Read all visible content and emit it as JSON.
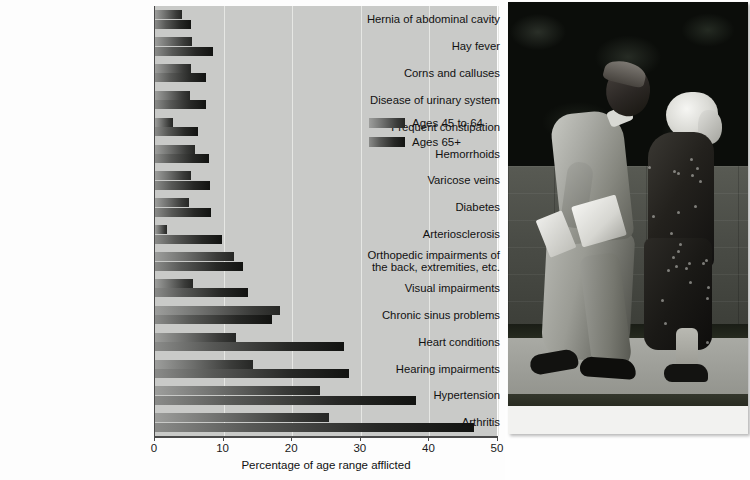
{
  "chart_data": {
    "type": "bar",
    "orientation": "horizontal",
    "grouped": true,
    "title": "",
    "xlabel": "Percentage of age range afflicted",
    "ylabel": "",
    "xlim": [
      0,
      50
    ],
    "xticks": [
      0,
      10,
      20,
      30,
      40,
      50
    ],
    "xtick_labels": [
      "0",
      "10",
      "20",
      "30",
      "40",
      "50"
    ],
    "grid": "vertical",
    "legend_position": "center-right-inside",
    "categories": [
      "Hernia of abdominal cavity",
      "Hay fever",
      "Corns and calluses",
      "Disease of urinary system",
      "Frequent constipation",
      "Hemorrhoids",
      "Varicose veins",
      "Diabetes",
      "Arteriosclerosis",
      "Orthopedic impairments of the back, extremities, etc.",
      "Visual impairments",
      "Chronic sinus problems",
      "Heart conditions",
      "Hearing impairments",
      "Hypertension",
      "Arthritis"
    ],
    "series": [
      {
        "name": "Ages 45 to 64",
        "values": [
          4.0,
          5.4,
          5.3,
          5.1,
          2.6,
          5.9,
          5.2,
          4.9,
          1.8,
          11.5,
          5.5,
          18.2,
          11.8,
          14.3,
          24.0,
          25.3
        ]
      },
      {
        "name": "Ages 65+",
        "values": [
          5.3,
          8.5,
          7.5,
          7.4,
          6.2,
          7.8,
          8.0,
          8.1,
          9.8,
          12.8,
          13.5,
          17.0,
          27.5,
          28.3,
          38.0,
          46.5
        ]
      }
    ]
  },
  "chart": {
    "x_axis_title": "Percentage of age range afflicted",
    "tick_labels": [
      "0",
      "10",
      "20",
      "30",
      "40",
      "50"
    ],
    "category_labels": [
      "Hernia of abdominal cavity",
      "Hay fever",
      "Corns and calluses",
      "Disease of urinary system",
      "Frequent constipation",
      "Hemorrhoids",
      "Varicose veins",
      "Diabetes",
      "Arteriosclerosis",
      "Orthopedic impairments of\nthe back, extremities, etc.",
      "Visual impairments",
      "Chronic sinus problems",
      "Heart conditions",
      "Hearing impairments",
      "Hypertension",
      "Arthritis"
    ],
    "legend": [
      {
        "label": "Ages 45 to 64",
        "color": "#4a4b49"
      },
      {
        "label": "Ages 65+",
        "color": "#1b1c1a"
      }
    ],
    "colors": {
      "plot_background": "#c9cac8",
      "gridline": "#e6e7e4",
      "axis": "#4a4a4a",
      "page_background": "#fdfdfd",
      "text": "#111111"
    }
  },
  "photo": {
    "name": "elderly-couple-walking-photograph",
    "description": "Black and white photograph of an elderly couple walking along a sidewalk past a stone wall"
  }
}
